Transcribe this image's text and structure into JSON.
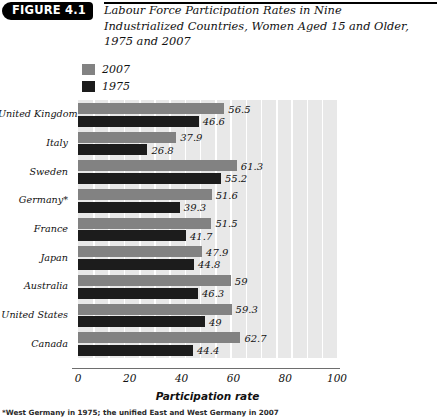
{
  "figure": {
    "badge": "FIGURE 4.1",
    "title": "Labour Force Participation Rates in Nine Industrialized Countries, Women Aged 15 and Older, 1975 and 2007",
    "footnote": "*West Germany in 1975; the unified East and West Germany in 2007"
  },
  "legend": {
    "position": "top-left",
    "items": [
      {
        "label": "2007",
        "color": "#828282"
      },
      {
        "label": "1975",
        "color": "#1c1c1c"
      }
    ]
  },
  "axis": {
    "x_title": "Participation rate",
    "ticks": [
      "0",
      "20",
      "40",
      "60",
      "80",
      "100"
    ]
  },
  "chart_data": {
    "type": "bar",
    "orientation": "horizontal",
    "title": "Labour Force Participation Rates in Nine Industrialized Countries, Women Aged 15 and Older, 1975 and 2007",
    "xlabel": "Participation rate",
    "ylabel": "",
    "xlim": [
      0,
      100
    ],
    "xticks": [
      0,
      20,
      40,
      60,
      80,
      100
    ],
    "grid": "vertical-bands",
    "legend_position": "above-plot-left",
    "categories": [
      "United Kingdom",
      "Italy",
      "Sweden",
      "Germany*",
      "France",
      "Japan",
      "Australia",
      "United States",
      "Canada"
    ],
    "series": [
      {
        "name": "2007",
        "color": "#828282",
        "values": [
          56.5,
          37.9,
          61.3,
          51.6,
          51.5,
          47.9,
          59,
          59.3,
          62.7
        ],
        "labels": [
          "56.5",
          "37.9",
          "61.3",
          "51.6",
          "51.5",
          "47.9",
          "59",
          "59.3",
          "62.7"
        ]
      },
      {
        "name": "1975",
        "color": "#1c1c1c",
        "values": [
          46.6,
          26.8,
          55.2,
          39.3,
          41.7,
          44.8,
          46.3,
          49,
          44.4
        ],
        "labels": [
          "46.6",
          "26.8",
          "55.2",
          "39.3",
          "41.7",
          "44.8",
          "46.3",
          "49",
          "44.4"
        ]
      }
    ],
    "annotations": [
      "*West Germany in 1975; the unified East and West Germany in 2007"
    ]
  }
}
